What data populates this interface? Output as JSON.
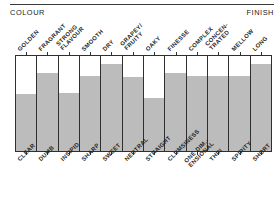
{
  "header": {
    "left_label": "COLOUR",
    "right_label": "FINISH"
  },
  "chart_data": {
    "type": "bar",
    "title": "",
    "subtitle": "",
    "xlabel": "",
    "ylabel": "",
    "ylim": [
      0,
      100
    ],
    "grid": false,
    "legend": "none",
    "orientation": "vertical",
    "axis_start_label": "COLOUR",
    "axis_end_label": "FINISH",
    "categories": [
      "GOLDEN",
      "FRAGRANT",
      "STRONG FLAVOUR",
      "SMOOTH",
      "DRY",
      "GRAPEY/ FRUITY",
      "OAKY",
      "FINESSE",
      "COMPLEX",
      "CONCEN- TRATED",
      "MELLOW",
      "LONG"
    ],
    "categories_bottom": [
      "CLEAR",
      "DUMB",
      "INSIPID",
      "SHARP",
      "SWEET",
      "NEUTRAL",
      "STRAIGHT",
      "CLUMSINESS",
      "ONE DIM.- ENSIONAL",
      "THIN",
      "SPIRITY",
      "SHORT"
    ],
    "values": [
      60,
      82,
      61,
      79,
      92,
      78,
      56,
      82,
      79,
      79,
      79,
      92
    ]
  },
  "scales": [
    {
      "top_label": "GOLDEN",
      "top_lines": [
        "GOLDEN"
      ],
      "bottom_label": "CLEAR",
      "bottom_lines": [
        "CLEAR"
      ],
      "value": 60
    },
    {
      "top_label": "FRAGRANT",
      "top_lines": [
        "FRAGRANT"
      ],
      "bottom_label": "DUMB",
      "bottom_lines": [
        "DUMB"
      ],
      "value": 82
    },
    {
      "top_label": "STRONG FLAVOUR",
      "top_lines": [
        "STRONG",
        "FLAVOUR"
      ],
      "bottom_label": "INSIPID",
      "bottom_lines": [
        "INSIPID"
      ],
      "value": 61
    },
    {
      "top_label": "SMOOTH",
      "top_lines": [
        "SMOOTH"
      ],
      "bottom_label": "SHARP",
      "bottom_lines": [
        "SHARP"
      ],
      "value": 79
    },
    {
      "top_label": "DRY",
      "top_lines": [
        "DRY"
      ],
      "bottom_label": "SWEET",
      "bottom_lines": [
        "SWEET"
      ],
      "value": 92
    },
    {
      "top_label": "GRAPEY/ FRUITY",
      "top_lines": [
        "GRAPEY/",
        "FRUITY"
      ],
      "bottom_label": "NEUTRAL",
      "bottom_lines": [
        "NEUTRAL"
      ],
      "value": 78
    },
    {
      "top_label": "OAKY",
      "top_lines": [
        "OAKY"
      ],
      "bottom_label": "STRAIGHT",
      "bottom_lines": [
        "STRAIGHT"
      ],
      "value": 56
    },
    {
      "top_label": "FINESSE",
      "top_lines": [
        "FINESSE"
      ],
      "bottom_label": "CLUMSINESS",
      "bottom_lines": [
        "CLUMSINESS"
      ],
      "value": 82
    },
    {
      "top_label": "COMPLEX",
      "top_lines": [
        "COMPLEX"
      ],
      "bottom_label": "ONE DIM.- ENSIONAL",
      "bottom_lines": [
        "ONE DIM.-",
        "ENSIONAL"
      ],
      "value": 79
    },
    {
      "top_label": "CONCEN- TRATED",
      "top_lines": [
        "CONCEN-",
        "TRATED"
      ],
      "bottom_label": "THIN",
      "bottom_lines": [
        "THIN"
      ],
      "value": 79
    },
    {
      "top_label": "MELLOW",
      "top_lines": [
        "MELLOW"
      ],
      "bottom_label": "SPIRITY",
      "bottom_lines": [
        "SPIRITY"
      ],
      "value": 79
    },
    {
      "top_label": "LONG",
      "top_lines": [
        "LONG"
      ],
      "bottom_label": "SHORT",
      "bottom_lines": [
        "SHORT"
      ],
      "value": 92
    }
  ],
  "style": {
    "fill_color": "#bcbcbc",
    "frame_color": "#2f2f2f",
    "text_color": "#1f1f1f",
    "background": "#ffffff"
  }
}
